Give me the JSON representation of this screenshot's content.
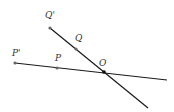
{
  "diagram": {
    "colors": {
      "line": "#1a1a1a",
      "point": "#666666",
      "label": "#333333",
      "center": "#111111"
    },
    "points": [
      {
        "id": "Qp",
        "label": "Q'",
        "x": 50,
        "y": 28,
        "lx": 45,
        "ly": 18
      },
      {
        "id": "Q",
        "label": "Q",
        "x": 76,
        "y": 49,
        "lx": 75,
        "ly": 41
      },
      {
        "id": "Pp",
        "label": "P'",
        "x": 15,
        "y": 63,
        "lx": 12,
        "ly": 56
      },
      {
        "id": "P",
        "label": "P",
        "x": 57,
        "y": 68,
        "lx": 55,
        "ly": 61
      },
      {
        "id": "O",
        "label": "O",
        "x": 104,
        "y": 72,
        "lx": 99,
        "ly": 66
      }
    ],
    "lines": [
      {
        "id": "line-PpO",
        "x1": 15,
        "y1": 63,
        "x2": 167,
        "y2": 80
      },
      {
        "id": "line-QpO",
        "x1": 50,
        "y1": 28,
        "x2": 148,
        "y2": 108
      }
    ]
  }
}
